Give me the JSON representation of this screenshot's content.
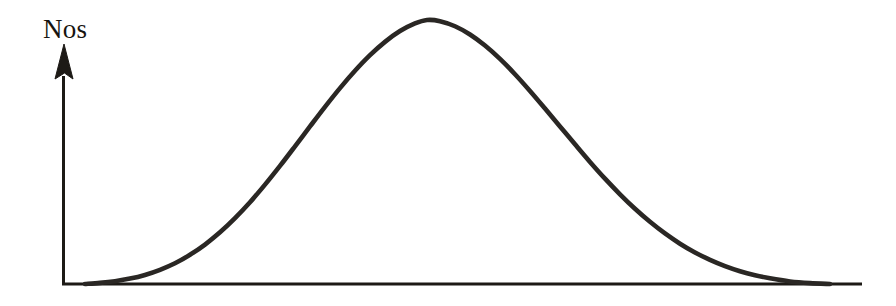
{
  "figure": {
    "title": "",
    "background_color": "#ffffff",
    "width": 896,
    "height": 306
  },
  "axes": {
    "y_axis": {
      "name": "vertical-axis",
      "label": "Nos",
      "color": "#1d1a16",
      "line_width": 3,
      "x": 63,
      "y_top": 76,
      "y_bottom": 285,
      "arrowhead": {
        "shape": "filled-triangle",
        "apex_x": 64,
        "apex_y": 44,
        "left_x": 55,
        "right_x": 73,
        "base_y": 79
      }
    },
    "x_axis": {
      "name": "horizontal-axis",
      "label": "",
      "color": "#1d1a16",
      "line_width": 3,
      "y": 284,
      "x_start": 62,
      "x_end": 862,
      "arrowhead": "none"
    }
  },
  "labels": {
    "y_axis_label": {
      "text": "Nos",
      "x": 43,
      "y": 38,
      "font_size": 27,
      "color": "#17140f"
    }
  },
  "chart_data": {
    "type": "line",
    "title": "",
    "subtitle": "",
    "xlabel": "",
    "ylabel": "Nos",
    "legend": [],
    "legend_position": "none",
    "grid": false,
    "xlim": [
      62,
      862
    ],
    "ylim": [
      0,
      100
    ],
    "annotations": [],
    "curve_style": {
      "color": "#2a2724",
      "line_width": 4.6,
      "line_cap": "round",
      "fill": "none"
    },
    "series": [
      {
        "name": "bell-curve",
        "x": [
          85,
          100,
          115,
          130,
          145,
          160,
          175,
          190,
          205,
          220,
          235,
          250,
          265,
          280,
          295,
          310,
          325,
          340,
          355,
          370,
          385,
          400,
          415,
          427,
          440,
          455,
          470,
          485,
          500,
          515,
          530,
          545,
          560,
          575,
          590,
          605,
          620,
          635,
          650,
          665,
          680,
          695,
          710,
          725,
          740,
          755,
          770,
          790,
          810,
          830
        ],
        "y": [
          0,
          0.4,
          1.0,
          1.9,
          3.2,
          5.0,
          7.3,
          10.3,
          13.9,
          18.2,
          23.2,
          28.8,
          35.0,
          41.6,
          48.5,
          55.5,
          62.4,
          69.0,
          75.1,
          80.6,
          85.3,
          89.1,
          91.8,
          93.0,
          92.6,
          90.8,
          87.9,
          84.0,
          79.3,
          73.9,
          68.0,
          61.8,
          55.5,
          49.2,
          43.0,
          37.1,
          31.6,
          26.5,
          21.9,
          17.8,
          14.2,
          11.1,
          8.5,
          6.3,
          4.5,
          3.1,
          2.0,
          0.9,
          0.3,
          0.0
        ]
      }
    ],
    "peak": {
      "x_pixel": 427,
      "y_pixel": 20,
      "value": 93.0
    },
    "baseline_y_pixel": 284,
    "left_foot_x_pixel": 90,
    "right_foot_x_pixel": 770
  }
}
